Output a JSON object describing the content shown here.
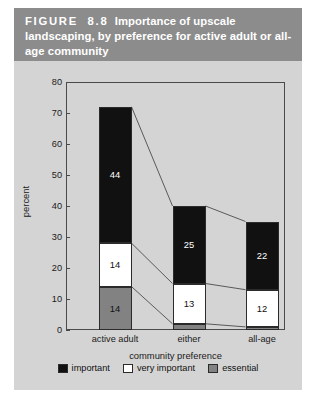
{
  "figure": {
    "caption_label": "FIGURE  8.8",
    "caption_rest": "  Importance of upscale landscaping, by preference for active adult or all-age community",
    "band_color": "#8c8c8c",
    "background_color": "#d4d4d4"
  },
  "chart_data": {
    "type": "bar",
    "stacked": true,
    "title": "Importance of upscale landscaping, by preference for active adult or all-age community",
    "xlabel": "community preference",
    "ylabel": "percent",
    "categories": [
      "active adult",
      "either",
      "all-age"
    ],
    "series": [
      {
        "name": "essential",
        "values": [
          14,
          2,
          1
        ],
        "color": "#828282"
      },
      {
        "name": "very important",
        "values": [
          14,
          13,
          12
        ],
        "color": "#ffffff"
      },
      {
        "name": "important",
        "values": [
          44,
          25,
          22
        ],
        "color": "#111111"
      }
    ],
    "totals": [
      72,
      40,
      35
    ],
    "ylim": [
      0,
      80
    ],
    "yticks": [
      0,
      10,
      20,
      30,
      40,
      50,
      60,
      70,
      80
    ],
    "ytick_labels": [
      "0",
      "10",
      "20",
      "30",
      "40",
      "50",
      "60",
      "70",
      "80"
    ],
    "grid": false,
    "legend_position": "bottom",
    "connectors": true,
    "data_labels": [
      {
        "category": "active adult",
        "essential": "14",
        "very_important": "14",
        "important": "44"
      },
      {
        "category": "either",
        "essential": "2",
        "very_important": "13",
        "important": "25"
      },
      {
        "category": "all-age",
        "essential": "1",
        "very_important": "12",
        "important": "22"
      }
    ]
  },
  "legend": {
    "items": [
      {
        "label": "important",
        "color": "#111111"
      },
      {
        "label": "very important",
        "color": "#ffffff"
      },
      {
        "label": "essential",
        "color": "#828282"
      }
    ]
  }
}
